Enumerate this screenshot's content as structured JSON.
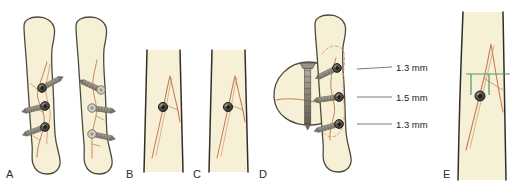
{
  "figure": {
    "background_color": "#ffffff",
    "bone_fill": "#f6f1d6",
    "bone_outline": "#4c4a3e",
    "fracture_line_color": "#c87a55",
    "fracture_dashed_color": "#cf8c63",
    "screw_body_color": "#8c877c",
    "screw_body_light": "#b4afa3",
    "screw_head_dark": "#4f4d46",
    "screw_head_ring": "#2f2e2a",
    "leader_line_color": "#6d6b63",
    "measure_bracket_color": "#4f9b56",
    "label_text_color": "#1d1d1d"
  },
  "panels": [
    {
      "id": "A",
      "label": "A",
      "label_x": 6,
      "label_y": 178,
      "name": "panel-a-three-screw-ap-and-lateral",
      "description": "Anteroposterior and lateral views of diaphysis with three lag screws"
    },
    {
      "id": "B",
      "label": "B",
      "label_x": 126,
      "label_y": 178,
      "name": "panel-b-single-screw-view-one",
      "description": "Close-up of single screw crossing spiral fracture"
    },
    {
      "id": "C",
      "label": "C",
      "label_x": 193,
      "label_y": 178,
      "name": "panel-c-single-screw-view-two",
      "description": "Close-up of single screw, rotated view"
    },
    {
      "id": "D",
      "label": "D",
      "label_x": 259,
      "label_y": 178,
      "name": "panel-d-cross-section-and-screw-spacing",
      "description": "Bone cross-section with screw and longitudinal view with screw spacing dimensions"
    },
    {
      "id": "E",
      "label": "E",
      "label_x": 443,
      "label_y": 178,
      "name": "panel-e-screw-position-measurement",
      "description": "Screw position with green measurement bracket at fracture apex"
    }
  ],
  "dimensions": {
    "name": "screw-spacing-callouts",
    "items": [
      {
        "value": "1.3 mm",
        "leader_from_x": 357,
        "leader_from_y": 69,
        "leader_to_x": 392,
        "leader_to_y": 67,
        "text_x": 396,
        "text_y": 71
      },
      {
        "value": "1.5 mm",
        "leader_from_x": 357,
        "leader_from_y": 97,
        "leader_to_x": 392,
        "leader_to_y": 97,
        "text_x": 396,
        "text_y": 101
      },
      {
        "value": "1.3 mm",
        "leader_from_x": 357,
        "leader_from_y": 124,
        "leader_to_x": 392,
        "leader_to_y": 124,
        "text_x": 396,
        "text_y": 128
      }
    ]
  },
  "screws": {
    "panel_a_ap": [
      {
        "head_x": 42,
        "head_y": 88,
        "angle": -28
      },
      {
        "head_x": 45,
        "head_y": 106,
        "angle": -14
      },
      {
        "head_x": 45,
        "head_y": 127,
        "angle": -20
      }
    ],
    "panel_a_lat": [
      {
        "head_x": 101,
        "head_y": 90,
        "angle": 24
      },
      {
        "head_x": 92,
        "head_y": 108,
        "angle": 8
      },
      {
        "head_x": 92,
        "head_y": 134,
        "angle": 12
      }
    ],
    "panel_b": [
      {
        "head_x": 163,
        "head_y": 107,
        "angle": 0
      }
    ],
    "panel_c": [
      {
        "head_x": 228,
        "head_y": 107,
        "angle": 0
      }
    ],
    "panel_d_section": [
      {
        "head_x": 308,
        "head_y": 70,
        "angle": 90
      }
    ],
    "panel_d_long": [
      {
        "head_x": 337,
        "head_y": 68,
        "angle": -26
      },
      {
        "head_x": 339,
        "head_y": 97,
        "angle": -8
      },
      {
        "head_x": 339,
        "head_y": 124,
        "angle": -16
      }
    ],
    "panel_e": [
      {
        "head_x": 480,
        "head_y": 96,
        "angle": 0
      }
    ]
  },
  "measurement_bracket": {
    "name": "green-measurement-bracket",
    "color": "#4f9b56",
    "top_y": 74,
    "left_x": 466,
    "right_x": 510,
    "drop_left_x": 471,
    "drop_right_x": 489,
    "drop_bottom_y": 95
  }
}
